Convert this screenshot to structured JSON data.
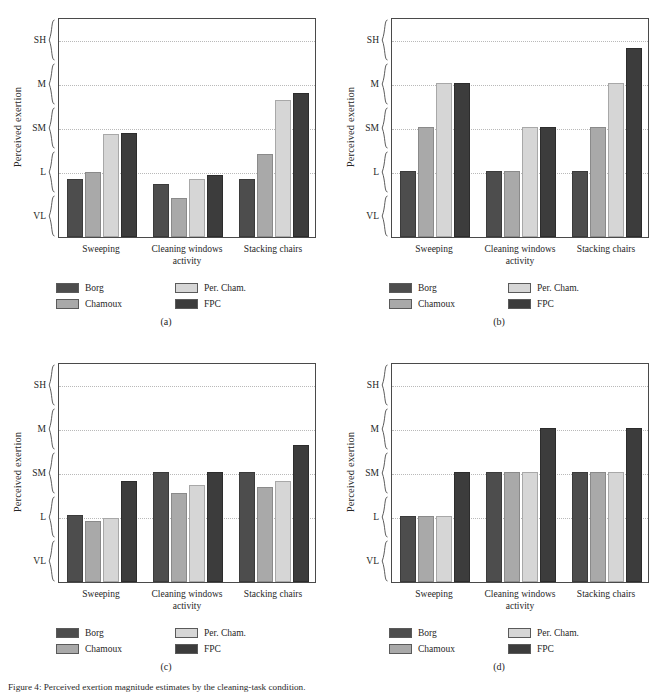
{
  "figure": {
    "axis": {
      "ylabel": "Perceived exertion",
      "yticks": [
        "SH",
        "M",
        "SM",
        "L",
        "VL"
      ],
      "xlabel_line2": "activity"
    },
    "legend": {
      "items": [
        {
          "label": "Borg",
          "key": "borg",
          "color": "#4d4d4d"
        },
        {
          "label": "Per. Cham.",
          "key": "percham",
          "color": "#d6d6d6"
        },
        {
          "label": "Chamoux",
          "key": "chamoux",
          "color": "#a9a9a9"
        },
        {
          "label": "FPC",
          "key": "fpc",
          "color": "#3c3c3c"
        }
      ]
    },
    "panel_captions": {
      "a": "(a)",
      "b": "(b)",
      "c": "(c)",
      "d": "(d)"
    },
    "caption_text": "Figure 4: Perceived exertion magnitude estimates by the cleaning-task condition."
  },
  "chart_data": [
    {
      "id": "a",
      "type": "bar",
      "title": "(a)",
      "xlabel": "activity",
      "ylabel": "Perceived exertion",
      "ytick_labels": [
        "VL",
        "L",
        "SM",
        "M",
        "SH"
      ],
      "ytick_values": [
        1,
        2,
        3,
        4,
        5
      ],
      "ylim": [
        0.5,
        5.5
      ],
      "grid": true,
      "legend_position": "below",
      "categories": [
        "Sweeping",
        "Cleaning windows",
        "Stacking chairs"
      ],
      "series": [
        {
          "name": "Borg",
          "values": [
            1.82,
            1.7,
            1.82
          ]
        },
        {
          "name": "Chamoux",
          "values": [
            1.98,
            1.38,
            2.38
          ]
        },
        {
          "name": "Per. Cham.",
          "values": [
            2.84,
            1.82,
            3.62
          ]
        },
        {
          "name": "FPC",
          "values": [
            2.86,
            1.9,
            3.78
          ]
        }
      ]
    },
    {
      "id": "b",
      "type": "bar",
      "title": "(b)",
      "xlabel": "activity",
      "ylabel": "Perceived exertion",
      "ytick_labels": [
        "VL",
        "L",
        "SM",
        "M",
        "SH"
      ],
      "ytick_values": [
        1,
        2,
        3,
        4,
        5
      ],
      "ylim": [
        0.5,
        5.5
      ],
      "grid": true,
      "legend_position": "below",
      "categories": [
        "Sweeping",
        "Cleaning windows",
        "Stacking chairs"
      ],
      "series": [
        {
          "name": "Borg",
          "values": [
            2.0,
            2.0,
            2.0
          ]
        },
        {
          "name": "Chamoux",
          "values": [
            3.0,
            2.0,
            3.0
          ]
        },
        {
          "name": "Per. Cham.",
          "values": [
            4.0,
            3.0,
            4.0
          ]
        },
        {
          "name": "FPC",
          "values": [
            4.0,
            3.0,
            4.8
          ]
        }
      ]
    },
    {
      "id": "c",
      "type": "bar",
      "title": "(c)",
      "xlabel": "activity",
      "ylabel": "Perceived exertion",
      "ytick_labels": [
        "VL",
        "L",
        "SM",
        "M",
        "SH"
      ],
      "ytick_values": [
        1,
        2,
        3,
        4,
        5
      ],
      "ylim": [
        0.5,
        5.5
      ],
      "grid": true,
      "legend_position": "below",
      "categories": [
        "Sweeping",
        "Cleaning windows",
        "Stacking chairs"
      ],
      "series": [
        {
          "name": "Borg",
          "values": [
            2.02,
            3.0,
            3.0
          ]
        },
        {
          "name": "Chamoux",
          "values": [
            1.88,
            2.52,
            2.66
          ]
        },
        {
          "name": "Per. Cham.",
          "values": [
            1.95,
            2.7,
            2.8
          ]
        },
        {
          "name": "FPC",
          "values": [
            2.8,
            3.0,
            3.62
          ]
        }
      ]
    },
    {
      "id": "d",
      "type": "bar",
      "title": "(d)",
      "xlabel": "activity",
      "ylabel": "Perceived exertion",
      "ytick_labels": [
        "VL",
        "L",
        "SM",
        "M",
        "SH"
      ],
      "ytick_values": [
        1,
        2,
        3,
        4,
        5
      ],
      "ylim": [
        0.5,
        5.5
      ],
      "grid": true,
      "legend_position": "below",
      "categories": [
        "Sweeping",
        "Cleaning windows",
        "Stacking chairs"
      ],
      "series": [
        {
          "name": "Borg",
          "values": [
            2.0,
            3.0,
            3.0
          ]
        },
        {
          "name": "Chamoux",
          "values": [
            2.0,
            3.0,
            3.0
          ]
        },
        {
          "name": "Per. Cham.",
          "values": [
            2.0,
            3.0,
            3.0
          ]
        },
        {
          "name": "FPC",
          "values": [
            3.0,
            4.0,
            4.0
          ]
        }
      ]
    }
  ]
}
